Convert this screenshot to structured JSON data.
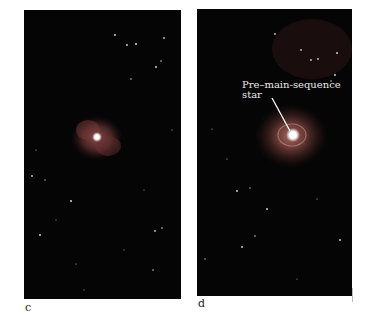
{
  "figure": {
    "panels": [
      {
        "id": "c",
        "label": "c",
        "description": "star-field with small reddish nebula and bright central star"
      },
      {
        "id": "d",
        "label": "d",
        "description": "star-field with larger glowing nebula around bright central star",
        "annotation": {
          "text": "Pre–main-sequence\nstar",
          "pointer": "line to central star"
        }
      }
    ]
  },
  "colors": {
    "background": "#ffffff",
    "sky": "#050505",
    "nebula": "#7a3a38",
    "star": "#ffffff",
    "label_text": "#222222",
    "annotation_text": "#e8e8e8"
  }
}
